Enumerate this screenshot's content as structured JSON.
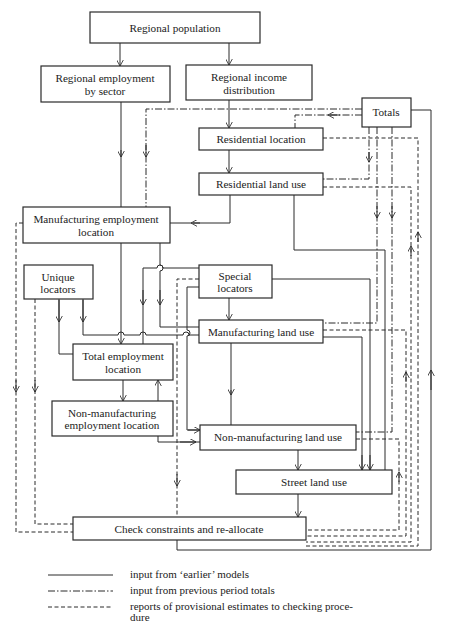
{
  "nodes": {
    "regional_population": {
      "lines": [
        "Regional population"
      ]
    },
    "regional_employment": {
      "lines": [
        "Regional employment",
        "by sector"
      ]
    },
    "regional_income": {
      "lines": [
        "Regional income",
        "distribution"
      ]
    },
    "totals": {
      "lines": [
        "Totals"
      ]
    },
    "residential_location": {
      "lines": [
        "Residential location"
      ]
    },
    "residential_land_use": {
      "lines": [
        "Residential land use"
      ]
    },
    "manufacturing_employment_location": {
      "lines": [
        "Manufacturing employment",
        "location"
      ]
    },
    "unique_locators": {
      "lines": [
        "Unique",
        "locators"
      ]
    },
    "special_locators": {
      "lines": [
        "Special",
        "locators"
      ]
    },
    "manufacturing_land_use": {
      "lines": [
        "Manufacturing land use"
      ]
    },
    "total_employment_location": {
      "lines": [
        "Total employment",
        "location"
      ]
    },
    "non_manufacturing_employment_location": {
      "lines": [
        "Non-manufacturing",
        "employment location"
      ]
    },
    "non_manufacturing_land_use": {
      "lines": [
        "Non-manufacturing land use"
      ]
    },
    "street_land_use": {
      "lines": [
        "Street land use"
      ]
    },
    "check_constraints": {
      "lines": [
        "Check constraints and re-allocate"
      ]
    }
  },
  "legend": {
    "solid": "input from ‘earlier’ models",
    "dashdot": "input from previous period totals",
    "dashed_line1": "reports of provisional estimates to checking proce-",
    "dashed_line2": "dure"
  }
}
